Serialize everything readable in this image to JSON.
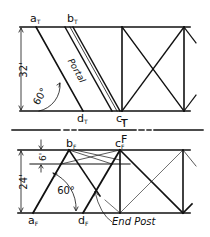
{
  "diagram": {
    "colors": {
      "line": "#111111",
      "background": "#ffffff"
    },
    "top_view": {
      "points": {
        "a": "a",
        "b": "b",
        "c": "c",
        "d": "d",
        "subscript": "T"
      },
      "height_dim": "32'",
      "angle": "60°",
      "member_label": "Portal"
    },
    "fold_line": {
      "upper_label": "T",
      "lower_label": "F"
    },
    "front_view": {
      "points": {
        "a": "a",
        "b": "b",
        "c": "c",
        "d": "d",
        "subscript": "F"
      },
      "height_dim": "24'",
      "sub_dim": "6'",
      "angle": "60°",
      "member_label": "End Post"
    }
  }
}
